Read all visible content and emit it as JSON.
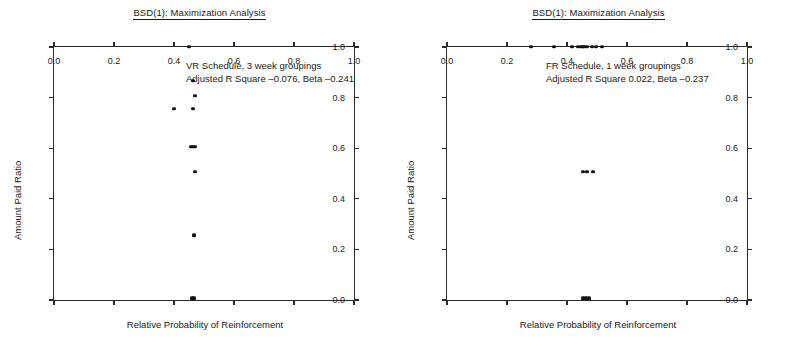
{
  "figure": {
    "width": 798,
    "height": 357,
    "background": "#ffffff",
    "point_color": "#111111",
    "axis_color": "#2b2b2b"
  },
  "panels": [
    {
      "id": "left",
      "title": "BSD(1): Maximization Analysis",
      "annotation_line1": "VR Schedule, 3 week groupings",
      "annotation_line2": "Adjusted R Square –0.076, Beta –0.241"
    },
    {
      "id": "right",
      "title": "BSD(1): Maximization Analysis",
      "annotation_line1": "FR Schedule, 1 week groupings",
      "annotation_line2": "Adjusted  R Square 0.022, Beta –0.237"
    }
  ],
  "axis": {
    "xlabel": "Relative Probability of Reinforcement",
    "ylabel": "Amount Paid Ratio",
    "xticks": [
      0.0,
      0.2,
      0.4,
      0.6,
      0.8,
      1.0
    ],
    "yticks": [
      0.0,
      0.2,
      0.4,
      0.6,
      0.8,
      1.0
    ],
    "xticklabels": [
      "0.0",
      "0.2",
      "0.4",
      "0.6",
      "0.8",
      "1.0"
    ],
    "yticklabels": [
      "0.0",
      "0.2",
      "0.4",
      "0.6",
      "0.8",
      "1.0"
    ],
    "xlim": [
      0.0,
      1.0
    ],
    "ylim": [
      0.0,
      1.0
    ]
  },
  "chart_data": [
    {
      "type": "scatter",
      "title": "BSD(1): Maximization Analysis",
      "subtitle": "VR Schedule, 3 week groupings",
      "annotation": "Adjusted R Square –0.076, Beta –0.241",
      "xlabel": "Relative Probability of Reinforcement",
      "ylabel": "Amount Paid Ratio",
      "xlim": [
        0.0,
        1.0
      ],
      "ylim": [
        0.0,
        1.0
      ],
      "grid": false,
      "legend": "none",
      "statistics": {
        "adjusted_r_square": -0.076,
        "beta": -0.241,
        "schedule": "VR",
        "grouping": "3 week groupings"
      },
      "points": [
        {
          "x": 0.449,
          "y": 1.0
        },
        {
          "x": 0.463,
          "y": 0.866
        },
        {
          "x": 0.47,
          "y": 0.806
        },
        {
          "x": 0.399,
          "y": 0.756
        },
        {
          "x": 0.463,
          "y": 0.756
        },
        {
          "x": 0.455,
          "y": 0.606
        },
        {
          "x": 0.463,
          "y": 0.606
        },
        {
          "x": 0.47,
          "y": 0.606
        },
        {
          "x": 0.47,
          "y": 0.506
        },
        {
          "x": 0.466,
          "y": 0.256
        },
        {
          "x": 0.459,
          "y": 0.006
        },
        {
          "x": 0.466,
          "y": 0.006
        }
      ]
    },
    {
      "type": "scatter",
      "title": "BSD(1): Maximization Analysis",
      "subtitle": "FR Schedule, 1 week groupings",
      "annotation": "Adjusted  R Square 0.022, Beta –0.237",
      "xlabel": "Relative Probability of Reinforcement",
      "ylabel": "Amount Paid Ratio",
      "xlim": [
        0.0,
        1.0
      ],
      "ylim": [
        0.0,
        1.0
      ],
      "grid": false,
      "legend": "none",
      "statistics": {
        "adjusted_r_square": 0.022,
        "beta": -0.237,
        "schedule": "FR",
        "grouping": "1 week groupings"
      },
      "points": [
        {
          "x": 0.281,
          "y": 1.0
        },
        {
          "x": 0.357,
          "y": 1.0
        },
        {
          "x": 0.417,
          "y": 1.0
        },
        {
          "x": 0.438,
          "y": 1.0
        },
        {
          "x": 0.446,
          "y": 1.0
        },
        {
          "x": 0.452,
          "y": 1.0
        },
        {
          "x": 0.458,
          "y": 1.0
        },
        {
          "x": 0.465,
          "y": 1.0
        },
        {
          "x": 0.483,
          "y": 1.0
        },
        {
          "x": 0.497,
          "y": 1.0
        },
        {
          "x": 0.516,
          "y": 1.0
        },
        {
          "x": 0.452,
          "y": 0.506
        },
        {
          "x": 0.466,
          "y": 0.506
        },
        {
          "x": 0.486,
          "y": 0.506
        },
        {
          "x": 0.452,
          "y": 0.006
        },
        {
          "x": 0.463,
          "y": 0.006
        },
        {
          "x": 0.474,
          "y": 0.006
        }
      ]
    }
  ]
}
